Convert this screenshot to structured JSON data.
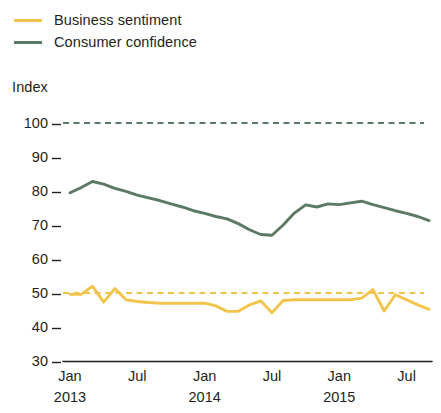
{
  "legend": {
    "items": [
      {
        "label": "Business sentiment",
        "color": "#F2C44C",
        "key": "business_sentiment"
      },
      {
        "label": "Consumer confidence",
        "color": "#5C7A63",
        "key": "consumer_confidence"
      }
    ]
  },
  "axis": {
    "y_title": "Index",
    "y_ticks": [
      "100",
      "90",
      "80",
      "70",
      "60",
      "50",
      "40",
      "30"
    ],
    "x_ticks": [
      {
        "month": "Jan",
        "year": "2013"
      },
      {
        "month": "Jul",
        "year": ""
      },
      {
        "month": "Jan",
        "year": "2014"
      },
      {
        "month": "Jul",
        "year": ""
      },
      {
        "month": "Jan",
        "year": "2015"
      },
      {
        "month": "Jul",
        "year": ""
      }
    ]
  },
  "chart_data": {
    "type": "line",
    "title": "",
    "xlabel": "",
    "ylabel": "Index",
    "ylim": [
      30,
      100
    ],
    "yticks": [
      30,
      40,
      50,
      60,
      70,
      80,
      90,
      100
    ],
    "grid": false,
    "legend_position": "top-left",
    "x": [
      "2013-01",
      "2013-02",
      "2013-03",
      "2013-04",
      "2013-05",
      "2013-06",
      "2013-07",
      "2013-08",
      "2013-09",
      "2013-10",
      "2013-11",
      "2013-12",
      "2014-01",
      "2014-02",
      "2014-03",
      "2014-04",
      "2014-05",
      "2014-06",
      "2014-07",
      "2014-08",
      "2014-09",
      "2014-10",
      "2014-11",
      "2014-12",
      "2015-01",
      "2015-02",
      "2015-03",
      "2015-04",
      "2015-05",
      "2015-06",
      "2015-07",
      "2015-08",
      "2015-09"
    ],
    "x_tick_labels": [
      "Jan 2013",
      "Jul",
      "Jan 2014",
      "Jul",
      "Jan 2015",
      "Jul"
    ],
    "series": [
      {
        "name": "Consumer confidence",
        "color": "#5C7A63",
        "values": [
          79.5,
          81.0,
          82.8,
          82.0,
          80.8,
          79.9,
          78.8,
          78.0,
          77.2,
          76.2,
          75.3,
          74.2,
          73.4,
          72.5,
          71.8,
          70.4,
          68.6,
          67.2,
          67.0,
          70.0,
          73.5,
          75.9,
          75.3,
          76.2,
          76.0,
          76.5,
          77.0,
          76.0,
          75.1,
          74.2,
          73.4,
          72.5,
          71.3
        ]
      },
      {
        "name": "Business sentiment",
        "color": "#F2C44C",
        "values": [
          49.6,
          49.6,
          52.0,
          47.3,
          51.3,
          48.0,
          47.5,
          47.2,
          47.0,
          47.0,
          47.0,
          47.0,
          47.0,
          46.2,
          44.6,
          44.6,
          46.5,
          47.7,
          44.2,
          47.8,
          48.0,
          48.0,
          48.0,
          48.0,
          48.0,
          48.0,
          48.5,
          51.0,
          44.7,
          49.5,
          48.0,
          46.5,
          45.2
        ]
      }
    ],
    "reference_lines": [
      {
        "name": "Consumer confidence reference",
        "value": 100,
        "color": "#5C7A63",
        "style": "dashed"
      },
      {
        "name": "Business sentiment reference",
        "value": 50,
        "color": "#F2C44C",
        "style": "dashed"
      }
    ]
  }
}
